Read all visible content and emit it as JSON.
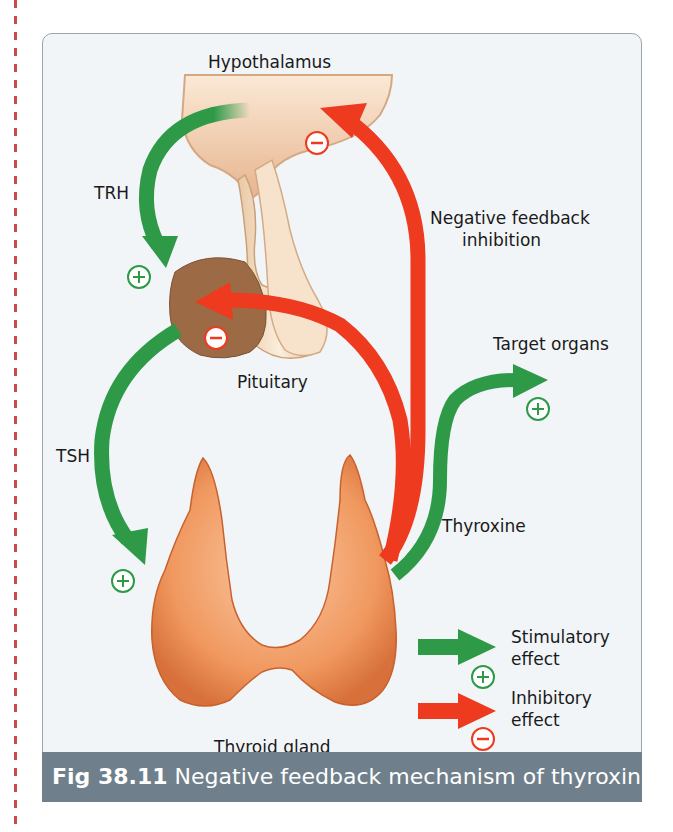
{
  "figure": {
    "caption_number": "Fig 38.11",
    "caption_text": " Negative feedback mechanism of thyroxine."
  },
  "labels": {
    "hypothalamus": "Hypothalamus",
    "trh": "TRH",
    "negative_feedback_line1": "Negative feedback",
    "negative_feedback_line2": "inhibition",
    "pituitary": "Pituitary",
    "target_organs": "Target organs",
    "tsh": "TSH",
    "thyroxine": "Thyroxine",
    "thyroid_gland": "Thyroid gland"
  },
  "legend": {
    "stimulatory_line1": "Stimulatory",
    "stimulatory_line2": "effect",
    "inhibitory_line1": "Inhibitory",
    "inhibitory_line2": "effect"
  },
  "colors": {
    "stimulatory": "#2e9a48",
    "inhibitory": "#ee3a1f",
    "thyroid": "#e98a52",
    "pituitary": "#9c6b45",
    "caption_bg": "#6f808c"
  }
}
